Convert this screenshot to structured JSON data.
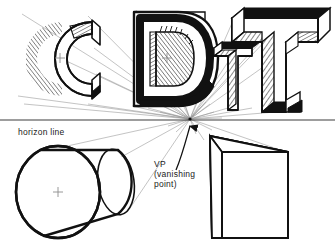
{
  "figure": {
    "type": "technical-illustration",
    "topic": "one-point perspective construction of extruded letterforms and solids",
    "labels": {
      "horizon_line": "horizon line",
      "vp_abbrev": "VP",
      "vp_expand_line1": "(vanishing",
      "vp_expand_line2": "point)"
    },
    "top_partial_text": "",
    "colors": {
      "ink": "#111111",
      "paper": "#ffffff",
      "construction_line": "#8d8d8d",
      "horizon": "#3c3c3c",
      "hatch": "#1a1a1a"
    },
    "geometry": {
      "vanishing_point": {
        "x": 190,
        "y": 119
      },
      "horizon_y": 120,
      "center_marks": [
        {
          "name": "letter-c-center",
          "x": 60,
          "y": 58
        },
        {
          "name": "letter-d-center",
          "x": 167,
          "y": 58
        },
        {
          "name": "cylinder-center",
          "x": 58,
          "y": 192
        }
      ]
    },
    "objects": [
      {
        "name": "letter-c",
        "label": "C",
        "style": "extruded-serif-slab, hatched inner face"
      },
      {
        "name": "letter-d",
        "label": "D",
        "style": "extruded bold, hatched counter"
      },
      {
        "name": "letter-t-small",
        "label": "T",
        "style": "extruded, hatched side faces"
      },
      {
        "name": "letter-t-large",
        "label": "T",
        "style": "extruded, hatched side faces"
      },
      {
        "name": "cylinder",
        "label": "",
        "style": "horizontal cylinder receding to VP"
      },
      {
        "name": "box",
        "label": "",
        "style": "rectangular prism receding to VP"
      }
    ]
  }
}
